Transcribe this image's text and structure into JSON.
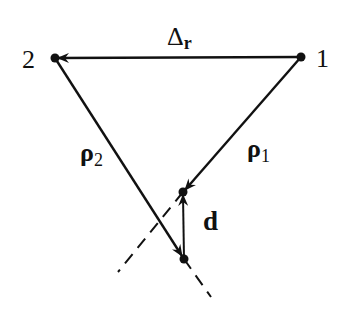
{
  "diagram": {
    "points": [
      {
        "id": "1",
        "label": "1",
        "x": 301,
        "y": 57
      },
      {
        "id": "2",
        "label": "2",
        "x": 55,
        "y": 58
      },
      {
        "id": "p1_end",
        "label": "",
        "x": 183,
        "y": 192
      },
      {
        "id": "p2_end",
        "label": "",
        "x": 184,
        "y": 259
      }
    ],
    "vectors": [
      {
        "name": "delta_r",
        "label_main": "Δ",
        "label_sub": "r",
        "from": "1",
        "to": "2"
      },
      {
        "name": "rho1",
        "label_main": "ρ",
        "label_sub": "1",
        "from": "1",
        "to": "p1_end"
      },
      {
        "name": "rho2",
        "label_main": "ρ",
        "label_sub": "2",
        "from": "2",
        "to": "p2_end"
      },
      {
        "name": "d",
        "label_main": "d",
        "label_sub": "",
        "from": "p2_end",
        "to": "p1_end"
      }
    ],
    "dashed_extensions": [
      {
        "from": "p1_end",
        "direction": "down-left"
      },
      {
        "from": "p2_end",
        "direction": "down-right"
      }
    ],
    "colors": {
      "ink": "#111111",
      "background": "#ffffff"
    }
  }
}
